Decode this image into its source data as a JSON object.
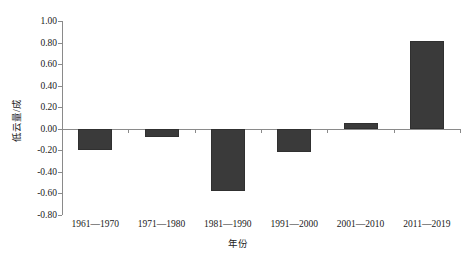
{
  "chart_data": {
    "type": "bar",
    "title": "",
    "subtitle": "",
    "xlabel": "年份",
    "ylabel": "低云量/成",
    "categories": [
      "1961—1970",
      "1971—1980",
      "1981—1990",
      "1991—2000",
      "2001—2010",
      "2011—2019"
    ],
    "values": [
      -0.2,
      -0.08,
      -0.58,
      -0.22,
      0.05,
      0.81
    ],
    "ylim": [
      -0.8,
      1.0
    ],
    "ytick_labels": [
      "1.00",
      "0.80",
      "0.60",
      "0.40",
      "0.20",
      "0.00",
      "-0.20",
      "-0.40",
      "-0.60",
      "-0.80"
    ],
    "ytick_values": [
      1.0,
      0.8,
      0.6,
      0.4,
      0.2,
      0.0,
      -0.2,
      -0.4,
      -0.6,
      -0.8
    ],
    "grid": false,
    "legend": null,
    "bar_color": "#3a3a3a",
    "axis_color": "#8a8a8a"
  },
  "axes": {
    "y_title": "低云量/成",
    "x_title": "年份"
  }
}
